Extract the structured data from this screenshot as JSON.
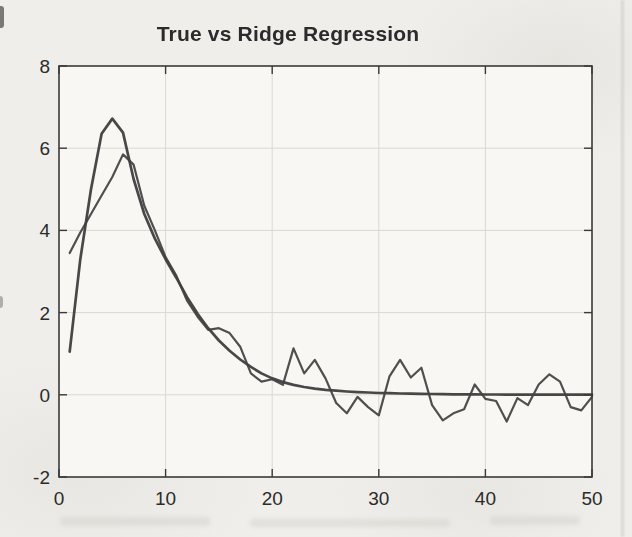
{
  "title": "True vs Ridge Regression",
  "colors": {
    "ink": "#3a3a3a",
    "line_true": "#3a3a3a",
    "line_ridge": "#424242",
    "grid": "#d9d8d1",
    "paper": "#efeeea",
    "plot_bg": "#f8f7f3",
    "text": "#2b2b2b"
  },
  "chart_data": {
    "type": "line",
    "title": "True vs Ridge Regression",
    "xlabel": "",
    "ylabel": "",
    "xlim": [
      0,
      50
    ],
    "ylim": [
      -2,
      8
    ],
    "xticks": [
      0,
      10,
      20,
      30,
      40,
      50
    ],
    "yticks": [
      -2,
      0,
      2,
      4,
      6,
      8
    ],
    "grid": true,
    "legend_position": "none",
    "x": [
      1,
      2,
      3,
      4,
      5,
      6,
      7,
      8,
      9,
      10,
      11,
      12,
      13,
      14,
      15,
      16,
      17,
      18,
      19,
      20,
      21,
      22,
      23,
      24,
      25,
      26,
      27,
      28,
      29,
      30,
      31,
      32,
      33,
      34,
      35,
      36,
      37,
      38,
      39,
      40,
      41,
      42,
      43,
      44,
      45,
      46,
      47,
      48,
      49,
      50
    ],
    "series": [
      {
        "name": "True",
        "values": [
          1.05,
          3.3,
          5.0,
          6.35,
          6.72,
          6.38,
          5.25,
          4.4,
          3.8,
          3.3,
          2.85,
          2.38,
          1.97,
          1.62,
          1.32,
          1.07,
          0.86,
          0.68,
          0.52,
          0.4,
          0.31,
          0.24,
          0.19,
          0.15,
          0.12,
          0.1,
          0.08,
          0.065,
          0.055,
          0.045,
          0.038,
          0.032,
          0.027,
          0.022,
          0.019,
          0.016,
          0.013,
          0.011,
          0.01,
          0.008,
          0.007,
          0.006,
          0.005,
          0.004,
          0.004,
          0.003,
          0.003,
          0.002,
          0.002,
          0.002
        ]
      },
      {
        "name": "Ridge Regression",
        "values": [
          3.45,
          3.95,
          4.4,
          4.85,
          5.3,
          5.85,
          5.6,
          4.6,
          4.0,
          3.35,
          2.9,
          2.3,
          1.9,
          1.58,
          1.62,
          1.5,
          1.17,
          0.52,
          0.32,
          0.38,
          0.24,
          1.13,
          0.52,
          0.85,
          0.4,
          -0.2,
          -0.45,
          -0.05,
          -0.3,
          -0.5,
          0.45,
          0.85,
          0.42,
          0.66,
          -0.25,
          -0.62,
          -0.45,
          -0.35,
          0.25,
          -0.1,
          -0.15,
          -0.65,
          -0.08,
          -0.25,
          0.25,
          0.5,
          0.32,
          -0.3,
          -0.38,
          -0.05
        ]
      }
    ]
  }
}
